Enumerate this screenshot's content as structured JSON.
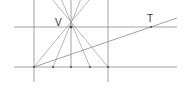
{
  "diagram": {
    "labels": {
      "vertex": "V",
      "tangent": "T"
    },
    "colors": {
      "line": "#8a8a8a",
      "point": "#444444",
      "label": "#333333"
    },
    "vertex_point": [
      71,
      27
    ],
    "baseline_points": [
      [
        34,
        67
      ],
      [
        53,
        67
      ],
      [
        71,
        67
      ],
      [
        90,
        67
      ],
      [
        108,
        67
      ]
    ]
  }
}
